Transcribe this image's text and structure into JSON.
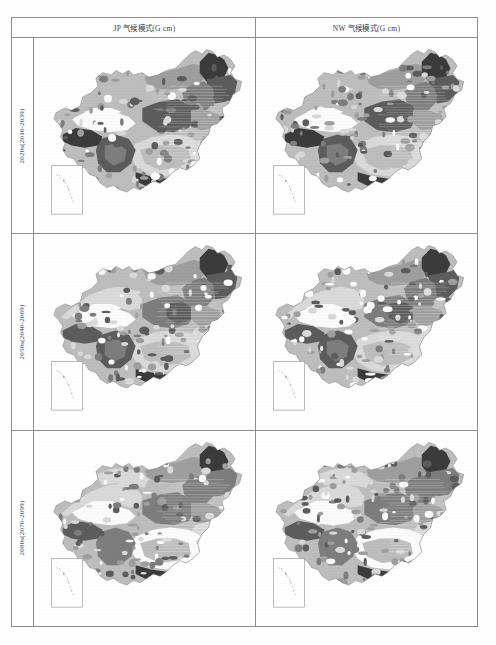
{
  "figure": {
    "type": "map-grid",
    "columns": [
      {
        "id": "jp",
        "header": "JP 气候模式(G cm)"
      },
      {
        "id": "nw",
        "header": "NW 气候模式(G cm)"
      }
    ],
    "rows": [
      {
        "id": "2020s",
        "label": "2020s(2010-2039)"
      },
      {
        "id": "2050s",
        "label": "2050s(2040-2069)"
      },
      {
        "id": "2080s",
        "label": "2080s(2070-2099)"
      }
    ],
    "cells": [
      {
        "row": "2020s",
        "column": "jp",
        "name": "china-map-jp-2020s"
      },
      {
        "row": "2020s",
        "column": "nw",
        "name": "china-map-nw-2020s"
      },
      {
        "row": "2050s",
        "column": "jp",
        "name": "china-map-jp-2050s"
      },
      {
        "row": "2050s",
        "column": "nw",
        "name": "china-map-nw-2050s"
      },
      {
        "row": "2080s",
        "column": "jp",
        "name": "china-map-jp-2080s"
      },
      {
        "row": "2080s",
        "column": "nw",
        "name": "china-map-nw-2080s"
      }
    ],
    "inset": {
      "name": "south-china-sea-inset"
    },
    "colors": {
      "border": "#8d8d8d",
      "text": "#3a3a3a",
      "background": "#ffffff",
      "class_very_low": "#fbfbfb",
      "class_low": "#d9d9d9",
      "class_mid_low": "#bdbdbd",
      "class_mid": "#9e9e9e",
      "class_mid_high": "#7d7d7d",
      "class_high": "#5c5c5c",
      "class_very_high": "#3b3b3b"
    }
  }
}
